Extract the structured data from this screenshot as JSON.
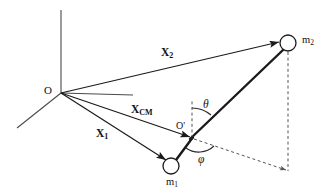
{
  "figure": {
    "background_color": "#ffffff",
    "stroke_color": "#1a1a1a",
    "dashed_color": "#555555"
  },
  "labels": {
    "origin": "O",
    "cm_point": "O'",
    "vector_x1_base": "X",
    "vector_x1_sub": "1",
    "vector_x2_base": "X",
    "vector_x2_sub": "2",
    "vector_xcm_base": "X",
    "vector_xcm_sub": "CM",
    "mass1_base": "m",
    "mass1_sub": "1",
    "mass2_base": "m",
    "mass2_sub": "2",
    "angle_theta": "θ",
    "angle_phi": "φ"
  },
  "geometry": {
    "origin": {
      "x": 61,
      "y": 93
    },
    "cm": {
      "x": 192,
      "y": 138
    },
    "mass1": {
      "x": 171,
      "y": 166,
      "r": 8
    },
    "mass2": {
      "x": 288,
      "y": 43,
      "r": 8
    },
    "axis_vertical_top": {
      "x": 61,
      "y": 10
    },
    "axis_horizontal_right": {
      "x": 133,
      "y": 95
    },
    "axis_diagonal_end": {
      "x": 17,
      "y": 128
    },
    "dashed_vertical_from_cm_top": {
      "x": 192,
      "y": 99
    },
    "dashed_corner": {
      "x": 288,
      "y": 171
    },
    "theta_degrees": 40,
    "phi_degrees": 24
  }
}
